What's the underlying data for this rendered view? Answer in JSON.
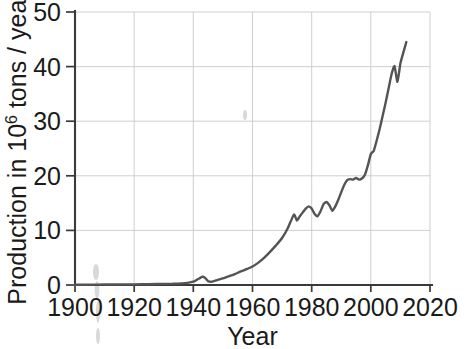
{
  "chart_data": {
    "type": "line",
    "title": "",
    "xlabel": "Year",
    "ylabel": "Production in 10",
    "ylabel_sup": "6",
    "ylabel_tail": " tons / year",
    "xlim": [
      1900,
      2020
    ],
    "ylim": [
      0,
      50
    ],
    "grid": true,
    "legend": null,
    "xticks": [
      1900,
      1920,
      1940,
      1960,
      1980,
      2000,
      2020
    ],
    "xtick_labels": [
      "1900",
      "1920",
      "1940",
      "1960",
      "1980",
      "2000",
      "2020"
    ],
    "yticks": [
      0,
      10,
      20,
      30,
      40,
      50
    ],
    "ytick_labels": [
      "0",
      "10",
      "20",
      "30",
      "40",
      "50"
    ],
    "line_color": "#545454",
    "grid_color": "#c9c9c9",
    "axis_color": "#3a3a3a",
    "series": [
      {
        "name": "Production",
        "x": [
          1900,
          1905,
          1910,
          1915,
          1920,
          1925,
          1930,
          1933,
          1936,
          1938,
          1940,
          1941,
          1942,
          1943,
          1944,
          1945,
          1946,
          1947,
          1948,
          1950,
          1952,
          1954,
          1956,
          1958,
          1960,
          1962,
          1964,
          1966,
          1968,
          1970,
          1972,
          1974,
          1975,
          1976,
          1977,
          1978,
          1979,
          1980,
          1981,
          1982,
          1983,
          1984,
          1985,
          1986,
          1987,
          1988,
          1989,
          1990,
          1991,
          1992,
          1993,
          1994,
          1995,
          1996,
          1997,
          1998,
          1999,
          2000,
          2001,
          2002,
          2003,
          2004,
          2005,
          2006,
          2007,
          2008,
          2009,
          2010,
          2011,
          2012
        ],
        "values": [
          0.05,
          0.06,
          0.08,
          0.1,
          0.12,
          0.15,
          0.2,
          0.22,
          0.3,
          0.4,
          0.6,
          0.9,
          1.2,
          1.5,
          1.3,
          0.7,
          0.6,
          0.7,
          0.9,
          1.2,
          1.6,
          2.0,
          2.5,
          2.9,
          3.4,
          4.1,
          5.0,
          6.1,
          7.3,
          8.6,
          10.5,
          12.9,
          11.8,
          12.6,
          13.3,
          14.0,
          14.4,
          14.0,
          13.0,
          12.6,
          13.5,
          14.8,
          15.2,
          14.6,
          13.6,
          14.4,
          15.6,
          17.0,
          18.3,
          19.2,
          19.4,
          19.3,
          19.6,
          19.3,
          19.5,
          20.2,
          21.9,
          24.0,
          24.6,
          26.5,
          28.6,
          31.0,
          33.4,
          36.0,
          38.6,
          40.1,
          37.2,
          40.6,
          42.6,
          44.5
        ],
        "color": "#545454"
      }
    ]
  },
  "axis": {
    "x_title": "Year",
    "y_title_prefix": "Production in 10",
    "y_title_sup": "6",
    "y_title_suffix": " tons / year"
  }
}
